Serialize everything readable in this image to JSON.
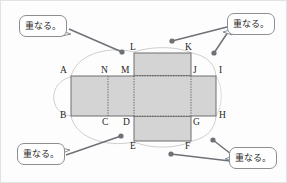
{
  "figure": {
    "colors": {
      "face_fill": "#d4d4d4",
      "face_stroke": "#6f6f6f",
      "fold_line": "#7a7a7a",
      "arc": "#cfcfcf",
      "leader": "#6e7276",
      "callout_border": "#8b8f93",
      "label_text": "#1d1d1d",
      "background": "#fdfdfd"
    },
    "vertices": [
      {
        "id": "A",
        "label": "A",
        "x": 70,
        "y": 75,
        "label_x": 60,
        "label_y": 69
      },
      {
        "id": "N",
        "label": "N",
        "x": 107,
        "y": 75,
        "label_x": 101,
        "label_y": 69
      },
      {
        "id": "M",
        "label": "M",
        "x": 133,
        "y": 75,
        "label_x": 120,
        "label_y": 69
      },
      {
        "id": "J",
        "label": "J",
        "x": 190,
        "y": 75,
        "label_x": 192,
        "label_y": 69
      },
      {
        "id": "I",
        "label": "I",
        "x": 215,
        "y": 75,
        "label_x": 218,
        "label_y": 69
      },
      {
        "id": "B",
        "label": "B",
        "x": 70,
        "y": 115,
        "label_x": 60,
        "label_y": 112
      },
      {
        "id": "C",
        "label": "C",
        "x": 107,
        "y": 115,
        "label_x": 101,
        "label_y": 117
      },
      {
        "id": "D",
        "label": "D",
        "x": 133,
        "y": 115,
        "label_x": 122,
        "label_y": 117
      },
      {
        "id": "G",
        "label": "G",
        "x": 190,
        "y": 115,
        "label_x": 192,
        "label_y": 117
      },
      {
        "id": "H",
        "label": "H",
        "x": 215,
        "y": 115,
        "label_x": 218,
        "label_y": 112
      },
      {
        "id": "L",
        "label": "L",
        "x": 133,
        "y": 52,
        "label_x": 129,
        "label_y": 43
      },
      {
        "id": "K",
        "label": "K",
        "x": 190,
        "y": 52,
        "label_x": 185,
        "label_y": 43
      },
      {
        "id": "E",
        "label": "E",
        "x": 133,
        "y": 140,
        "label_x": 129,
        "label_y": 142
      },
      {
        "id": "F",
        "label": "F",
        "x": 190,
        "y": 140,
        "label_x": 185,
        "label_y": 142
      }
    ],
    "faces": [
      {
        "name": "face-left-outer",
        "x": 70,
        "y": 75,
        "w": 37,
        "h": 40
      },
      {
        "name": "face-left-inner",
        "x": 107,
        "y": 75,
        "w": 26,
        "h": 40
      },
      {
        "name": "face-center",
        "x": 133,
        "y": 75,
        "w": 57,
        "h": 40
      },
      {
        "name": "face-right",
        "x": 190,
        "y": 75,
        "w": 25,
        "h": 40
      },
      {
        "name": "face-top",
        "x": 133,
        "y": 52,
        "w": 57,
        "h": 23
      },
      {
        "name": "face-bottom",
        "x": 133,
        "y": 115,
        "w": 57,
        "h": 25
      }
    ],
    "fold_lines": [
      {
        "name": "fold-N-C",
        "x1": 107,
        "y1": 75,
        "x2": 107,
        "y2": 115
      },
      {
        "name": "fold-M-D",
        "x1": 133,
        "y1": 75,
        "x2": 133,
        "y2": 115
      },
      {
        "name": "fold-J-G",
        "x1": 190,
        "y1": 75,
        "x2": 190,
        "y2": 115
      },
      {
        "name": "fold-M-J",
        "x1": 133,
        "y1": 75,
        "x2": 190,
        "y2": 75
      },
      {
        "name": "fold-D-G",
        "x1": 133,
        "y1": 115,
        "x2": 190,
        "y2": 115
      }
    ],
    "arcs": [
      {
        "name": "arc-A-L",
        "d": "M 70 76 C 72 54 104 45 133 51"
      },
      {
        "name": "arc-B-E",
        "d": "M 70 114 C 72 136 104 146 133 141"
      },
      {
        "name": "arc-K-I",
        "d": "M 190 51 C 206 53 214 62 215 74"
      },
      {
        "name": "arc-F-H",
        "d": "M 190 141 C 206 138 214 128 215 116"
      },
      {
        "name": "arc-outer-left",
        "d": "M 70 76 C 50 80 48 110 70 114"
      },
      {
        "name": "arc-L-K-top",
        "d": "M 133 51 C 150 46 175 46 190 51"
      },
      {
        "name": "arc-E-F-bottom",
        "d": "M 133 141 C 150 147 175 147 190 141"
      }
    ],
    "callouts": [
      {
        "name": "callout-top-left",
        "text": "重なる。",
        "box": {
          "x": 18,
          "y": 14,
          "w": 48,
          "h": 22
        },
        "tail": "M 62 28 L 70 33 L 62 34 Z",
        "leader": {
          "x1": 66,
          "y1": 28,
          "x2": 120,
          "y2": 51
        },
        "dot": {
          "x": 120,
          "y": 51
        }
      },
      {
        "name": "callout-top-right",
        "text": "重なる。",
        "box": {
          "x": 225,
          "y": 12,
          "w": 48,
          "h": 22
        },
        "tail": "M 229 30 L 221 36 L 229 35 Z",
        "leader": {
          "x1": 225,
          "y1": 28,
          "x2": 171,
          "y2": 40
        },
        "dot": {
          "x": 171,
          "y": 40
        },
        "leader2": {
          "x1": 228,
          "y1": 31,
          "x2": 212,
          "y2": 52
        },
        "dot2": {
          "x": 212,
          "y": 52
        }
      },
      {
        "name": "callout-bottom-left",
        "text": "重なる。",
        "box": {
          "x": 16,
          "y": 147,
          "w": 48,
          "h": 22
        },
        "tail": "M 60 149 L 69 145 L 61 144 Z",
        "leader": {
          "x1": 64,
          "y1": 152,
          "x2": 120,
          "y2": 134
        },
        "dot": {
          "x": 120,
          "y": 134
        }
      },
      {
        "name": "callout-bottom-right",
        "text": "重なる。",
        "box": {
          "x": 228,
          "y": 148,
          "w": 48,
          "h": 22
        },
        "tail": "M 232 152 L 223 147 L 231 146 Z",
        "leader": {
          "x1": 228,
          "y1": 159,
          "x2": 170,
          "y2": 152
        },
        "dot": {
          "x": 170,
          "y": 152
        },
        "leader2": {
          "x1": 230,
          "y1": 152,
          "x2": 213,
          "y2": 139
        },
        "dot2": {
          "x": 213,
          "y": 139
        }
      }
    ]
  }
}
